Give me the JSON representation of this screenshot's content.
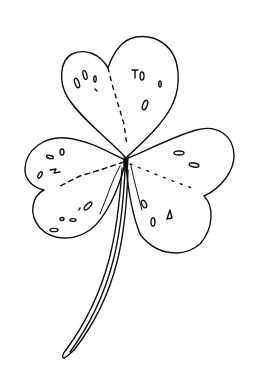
{
  "image": {
    "subject": "shamrock line drawing",
    "description": "Hand-drawn three-leaf clover (shamrock) with heart-shaped leaves, dashed midribs, small spots, and a long curved stem",
    "colors": {
      "background": "#ffffff",
      "ink": "#111111"
    },
    "leaves": 3
  }
}
